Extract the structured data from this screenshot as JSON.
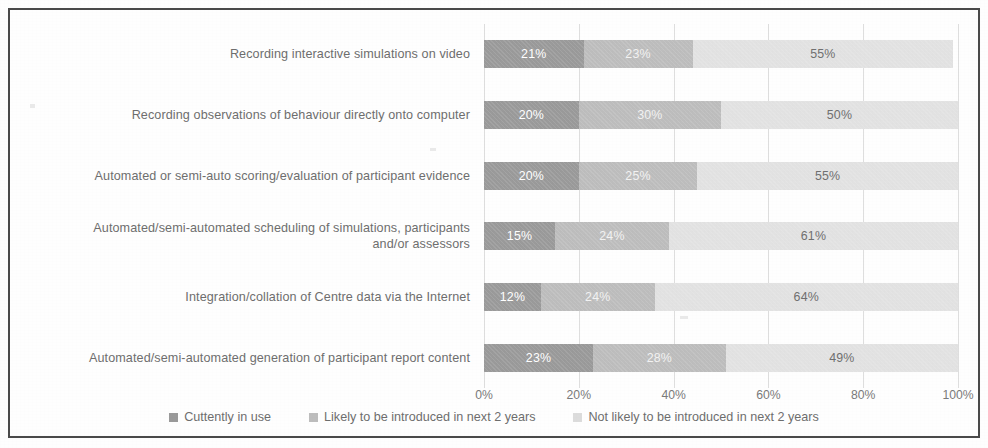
{
  "chart_data": {
    "type": "bar",
    "orientation": "horizontal",
    "stacked": true,
    "stack_mode": "percent",
    "title": "",
    "subtitle": "",
    "xlabel": "",
    "ylabel": "",
    "xlim": [
      0,
      100
    ],
    "xticks": [
      "0%",
      "20%",
      "40%",
      "60%",
      "80%",
      "100%"
    ],
    "xtick_values": [
      0,
      20,
      40,
      60,
      80,
      100
    ],
    "grid": true,
    "grid_axis": "x",
    "legend_position": "bottom",
    "categories": [
      "Recording interactive simulations on video",
      "Recording observations of behaviour directly onto computer",
      "Automated or semi-auto scoring/evaluation of participant evidence",
      "Automated/semi-automated scheduling of simulations, participants\nand/or assessors",
      "Integration/collation of Centre data via the Internet",
      "Automated/semi-automated generation of participant report content"
    ],
    "series": [
      {
        "name": "Cuttently in use",
        "color": "#9a9a9a",
        "values": [
          21,
          20,
          20,
          15,
          12,
          23
        ],
        "labels": [
          "21%",
          "20%",
          "20%",
          "15%",
          "12%",
          "23%"
        ]
      },
      {
        "name": "Likely to be introduced in next 2 years",
        "color": "#bdbdbd",
        "values": [
          23,
          30,
          25,
          24,
          24,
          28
        ],
        "labels": [
          "23%",
          "30%",
          "25%",
          "24%",
          "24%",
          "28%"
        ]
      },
      {
        "name": "Not likely to be introduced in next 2 years",
        "color": "#e2e2e2",
        "values": [
          55,
          50,
          55,
          61,
          64,
          49
        ],
        "labels": [
          "55%",
          "50%",
          "55%",
          "61%",
          "64%",
          "49%"
        ]
      }
    ]
  }
}
